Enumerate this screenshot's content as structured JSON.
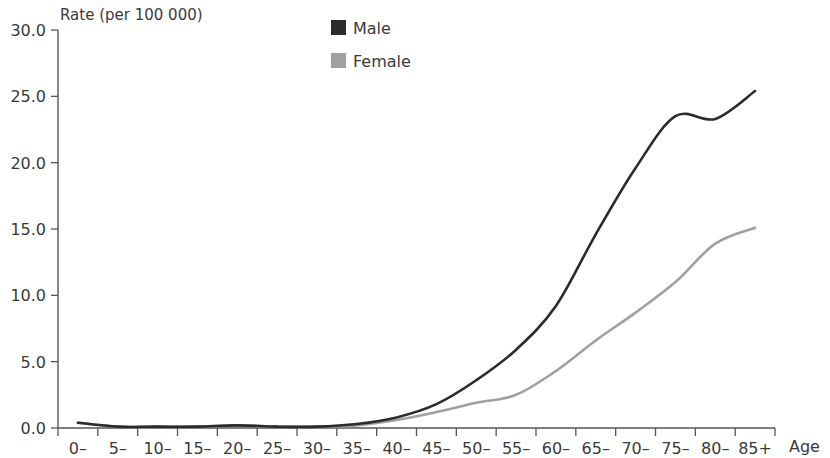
{
  "chart_data": {
    "type": "line",
    "title": "",
    "subtitle": "",
    "xlabel": "Age",
    "ylabel": "Rate (per 100 000)",
    "grid": false,
    "legend_position": "top-center",
    "categories": [
      "0–",
      "5–",
      "10–",
      "15–",
      "20–",
      "25–",
      "30–",
      "35–",
      "40–",
      "45–",
      "50–",
      "55–",
      "60–",
      "65–",
      "70–",
      "75–",
      "80–",
      "85+"
    ],
    "xlim": [
      0,
      18
    ],
    "ylim": [
      0.0,
      30.0
    ],
    "yticks": [
      0.0,
      5.0,
      10.0,
      15.0,
      20.0,
      25.0,
      30.0
    ],
    "ytick_labels": [
      "0.0",
      "5.0",
      "10.0",
      "15.0",
      "20.0",
      "25.0",
      "30.0"
    ],
    "series": [
      {
        "name": "Male",
        "color": "#2b2b2b",
        "values": [
          0.4,
          0.1,
          0.1,
          0.1,
          0.2,
          0.1,
          0.1,
          0.3,
          0.8,
          1.8,
          3.6,
          5.9,
          9.2,
          14.6,
          19.6,
          23.5,
          23.3,
          25.4
        ]
      },
      {
        "name": "Female",
        "color": "#a0a0a0",
        "values": [
          0.4,
          0.1,
          0.1,
          0.1,
          0.2,
          0.1,
          0.1,
          0.2,
          0.6,
          1.2,
          1.9,
          2.5,
          4.3,
          6.6,
          8.7,
          11.0,
          13.9,
          15.1
        ]
      }
    ]
  },
  "legend": {
    "items": [
      {
        "label": "Male",
        "color": "#2b2b2b"
      },
      {
        "label": "Female",
        "color": "#a0a0a0"
      }
    ]
  },
  "axes": {
    "y_axis_title": "Rate (per 100 000)",
    "x_axis_title": "Age"
  }
}
